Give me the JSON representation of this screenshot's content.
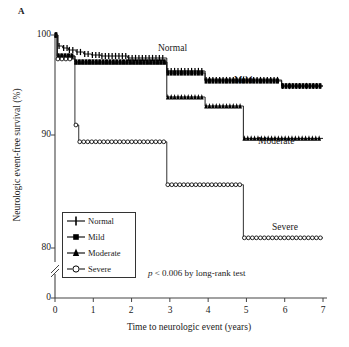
{
  "panel": {
    "label": "A"
  },
  "axes": {
    "ylabel": "Neurologic event-free survival (%)",
    "xlabel": "Time to neurologic event (years)",
    "yticks": [
      "100",
      "90",
      "80",
      "0"
    ],
    "xticks": [
      "0",
      "1",
      "2",
      "3",
      "4",
      "5",
      "6",
      "7"
    ],
    "y_axis_break": true
  },
  "annotations": {
    "normal": "Normal",
    "mild": "Mild",
    "moderate": "Moderate",
    "severe": "Severe",
    "pvalue_italic": "p",
    "pvalue_rest": " < 0.006 by long-rank test"
  },
  "legend": {
    "items": [
      {
        "label": "Normal",
        "marker": "cross-marker",
        "color": "#000000"
      },
      {
        "label": "Mild",
        "marker": "filled-square-marker",
        "color": "#000000"
      },
      {
        "label": "Moderate",
        "marker": "filled-triangle-marker",
        "color": "#000000"
      },
      {
        "label": "Severe",
        "marker": "open-circle-marker",
        "color": "#000000"
      }
    ]
  },
  "chart_data": {
    "type": "line",
    "subtype": "kaplan-meier-step",
    "title": "",
    "xlabel": "Time to neurologic event (years)",
    "ylabel": "Neurologic event-free survival (%)",
    "xlim": [
      0,
      7
    ],
    "ylim": [
      80,
      100
    ],
    "y_axis_break_below": 80,
    "y_zero_shown": true,
    "grid": false,
    "legend_position": "lower-left-inside",
    "annotation": "p < 0.006 by long-rank test",
    "series": [
      {
        "name": "Normal",
        "marker": "cross-marker",
        "color": "#000000",
        "steps": [
          [
            0.0,
            100.0
          ],
          [
            0.08,
            98.9
          ],
          [
            0.2,
            98.7
          ],
          [
            0.35,
            98.5
          ],
          [
            0.55,
            98.3
          ],
          [
            0.75,
            98.1
          ],
          [
            0.95,
            98.0
          ],
          [
            1.2,
            97.9
          ],
          [
            1.9,
            97.7
          ],
          [
            2.9,
            97.7
          ],
          [
            2.92,
            96.4
          ],
          [
            3.9,
            96.4
          ],
          [
            3.92,
            95.5
          ],
          [
            5.9,
            95.5
          ],
          [
            5.92,
            94.9
          ],
          [
            7.0,
            94.9
          ]
        ]
      },
      {
        "name": "Mild",
        "marker": "filled-square-marker",
        "color": "#000000",
        "steps": [
          [
            0.0,
            100.0
          ],
          [
            0.06,
            97.9
          ],
          [
            0.5,
            97.9
          ],
          [
            0.52,
            97.3
          ],
          [
            2.9,
            97.3
          ],
          [
            2.92,
            96.2
          ],
          [
            3.9,
            96.2
          ],
          [
            3.92,
            95.4
          ],
          [
            5.9,
            95.4
          ],
          [
            5.92,
            94.9
          ],
          [
            7.0,
            94.9
          ]
        ]
      },
      {
        "name": "Moderate",
        "marker": "filled-triangle-marker",
        "color": "#000000",
        "steps": [
          [
            0.0,
            100.0
          ],
          [
            0.06,
            97.9
          ],
          [
            0.5,
            97.9
          ],
          [
            0.52,
            97.3
          ],
          [
            2.9,
            97.3
          ],
          [
            2.92,
            93.8
          ],
          [
            3.9,
            93.8
          ],
          [
            3.92,
            92.9
          ],
          [
            4.9,
            92.9
          ],
          [
            4.92,
            89.7
          ],
          [
            7.0,
            89.7
          ]
        ]
      },
      {
        "name": "Severe",
        "marker": "open-circle-marker",
        "color": "#000000",
        "steps": [
          [
            0.0,
            100.0
          ],
          [
            0.05,
            97.6
          ],
          [
            0.5,
            97.6
          ],
          [
            0.52,
            91.0
          ],
          [
            0.6,
            91.0
          ],
          [
            0.62,
            89.4
          ],
          [
            2.9,
            89.4
          ],
          [
            2.92,
            85.6
          ],
          [
            4.9,
            85.6
          ],
          [
            4.92,
            80.9
          ],
          [
            7.0,
            80.9
          ]
        ]
      }
    ]
  }
}
